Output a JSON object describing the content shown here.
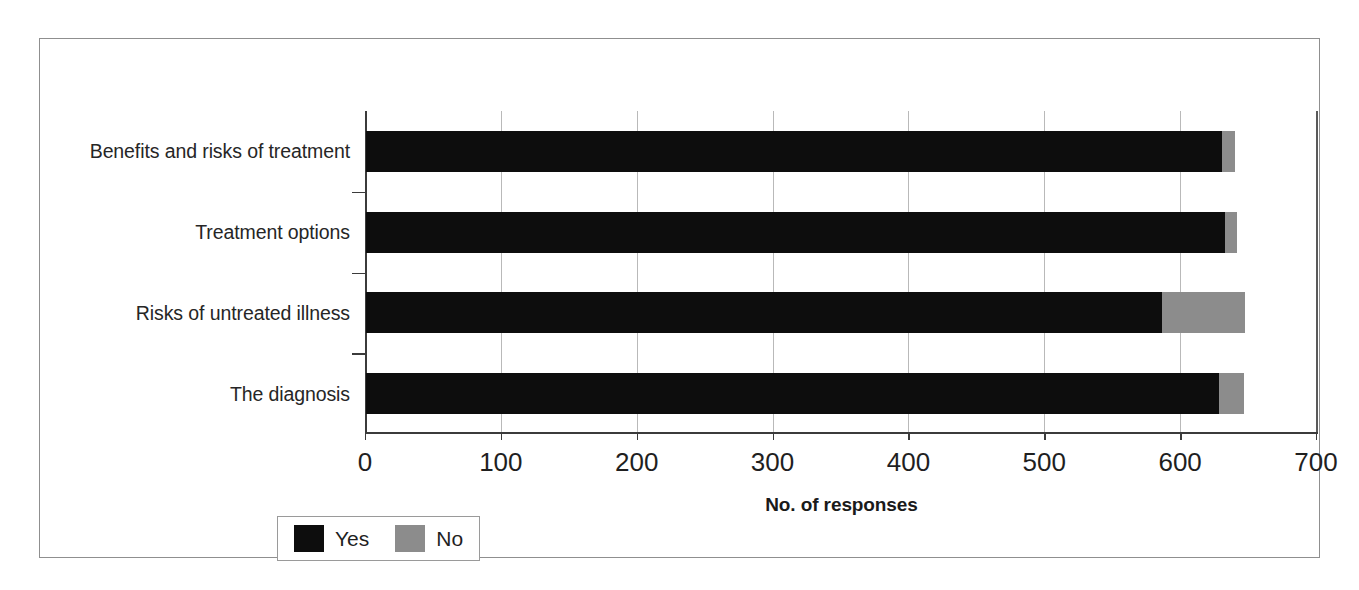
{
  "chart_data": {
    "type": "bar",
    "orientation": "horizontal",
    "stacked": true,
    "title": "",
    "xlabel": "No. of responses",
    "ylabel": "",
    "xlim": [
      0,
      700
    ],
    "xticks": [
      0,
      100,
      200,
      300,
      400,
      500,
      600,
      700
    ],
    "xtick_labels": [
      "0",
      "100",
      "200",
      "300",
      "400",
      "500",
      "600",
      "700"
    ],
    "grid": "vertical",
    "legend_position": "bottom-left",
    "categories": [
      "Benefits and risks of treatment",
      "Treatment options",
      "Risks of untreated illness",
      "The diagnosis"
    ],
    "series": [
      {
        "name": "Yes",
        "color": "#0d0d0d",
        "values": [
          630,
          632,
          586,
          628
        ]
      },
      {
        "name": "No",
        "color": "#8c8c8c",
        "values": [
          10,
          9,
          61,
          18
        ]
      }
    ]
  },
  "legend": {
    "items": [
      {
        "label": "Yes",
        "color": "#0d0d0d"
      },
      {
        "label": "No",
        "color": "#8c8c8c"
      }
    ]
  },
  "axis": {
    "x_title": "No. of responses"
  },
  "colors": {
    "yes": "#0d0d0d",
    "no": "#8c8c8c",
    "frame": "#8f8f8f",
    "gridline": "#b9b9b9",
    "axis": "#3b3b3b",
    "background": "#ffffff"
  }
}
